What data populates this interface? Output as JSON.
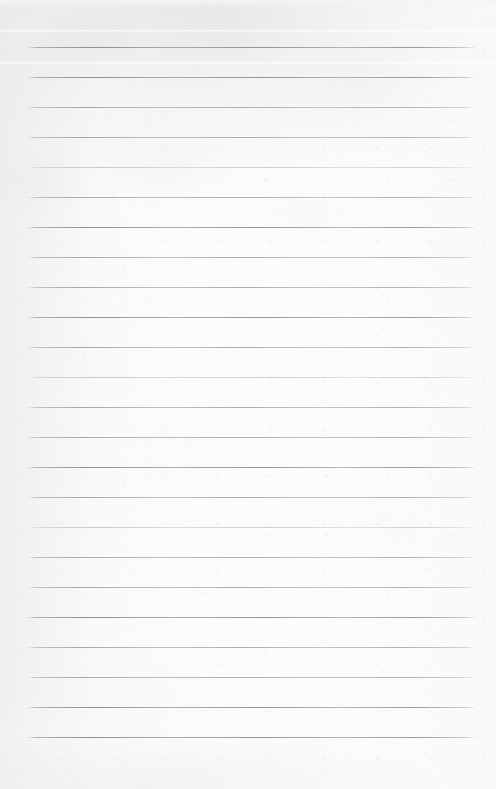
{
  "document": {
    "type": "ruled-notepaper-scan",
    "title": "Blank ruled notepaper",
    "content_text": "",
    "handwriting_present": "no",
    "width_px": 496,
    "height_px": 789
  },
  "paper": {
    "background_color": "#fcfcfc",
    "tint_color": "#e6e8ea",
    "texture": "subtle paper fiber grain with mottled scanner shading",
    "shading_regions": [
      "top band",
      "upper-left corner",
      "left edge",
      "bottom-left"
    ]
  },
  "rules": {
    "line_color": "#8e94a0",
    "line_color_faint": "#a8acb4",
    "line_thickness_px": 1,
    "left_x_px": 27,
    "right_x_px": 477,
    "first_line_y_px": 47,
    "spacing_px": 30,
    "count": 24,
    "lines": [
      {
        "index": 1,
        "y": 47,
        "weight": "dark"
      },
      {
        "index": 2,
        "y": 77,
        "weight": "dark"
      },
      {
        "index": 3,
        "y": 107,
        "weight": "normal"
      },
      {
        "index": 4,
        "y": 137,
        "weight": "normal"
      },
      {
        "index": 5,
        "y": 167,
        "weight": "faint"
      },
      {
        "index": 6,
        "y": 197,
        "weight": "normal"
      },
      {
        "index": 7,
        "y": 227,
        "weight": "dark"
      },
      {
        "index": 8,
        "y": 257,
        "weight": "normal"
      },
      {
        "index": 9,
        "y": 287,
        "weight": "normal"
      },
      {
        "index": 10,
        "y": 317,
        "weight": "dark"
      },
      {
        "index": 11,
        "y": 347,
        "weight": "normal"
      },
      {
        "index": 12,
        "y": 377,
        "weight": "faint"
      },
      {
        "index": 13,
        "y": 407,
        "weight": "normal"
      },
      {
        "index": 14,
        "y": 437,
        "weight": "normal"
      },
      {
        "index": 15,
        "y": 467,
        "weight": "dark"
      },
      {
        "index": 16,
        "y": 497,
        "weight": "normal"
      },
      {
        "index": 17,
        "y": 527,
        "weight": "faint"
      },
      {
        "index": 18,
        "y": 557,
        "weight": "normal"
      },
      {
        "index": 19,
        "y": 587,
        "weight": "normal"
      },
      {
        "index": 20,
        "y": 617,
        "weight": "dark"
      },
      {
        "index": 21,
        "y": 647,
        "weight": "normal"
      },
      {
        "index": 22,
        "y": 677,
        "weight": "normal"
      },
      {
        "index": 23,
        "y": 707,
        "weight": "dark"
      },
      {
        "index": 24,
        "y": 737,
        "weight": "dark"
      }
    ]
  },
  "streaks": [
    {
      "name": "light-streak-top",
      "y": 30
    },
    {
      "name": "light-streak-upper",
      "y": 62
    }
  ]
}
